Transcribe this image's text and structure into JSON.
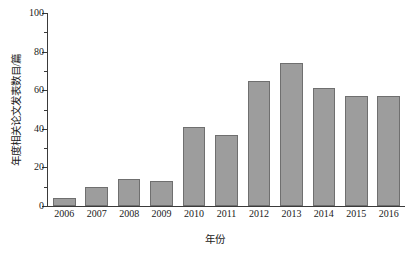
{
  "chart_data": {
    "type": "bar",
    "title": "",
    "xlabel": "年份",
    "ylabel": "年度相关论文发表数目/篇",
    "categories": [
      "2006",
      "2007",
      "2008",
      "2009",
      "2010",
      "2011",
      "2012",
      "2013",
      "2014",
      "2015",
      "2016"
    ],
    "values": [
      4,
      10,
      14,
      13,
      41,
      37,
      65,
      74,
      61,
      57,
      57
    ],
    "series": [
      {
        "name": "年度相关论文发表数目",
        "values": [
          4,
          10,
          14,
          13,
          41,
          37,
          65,
          74,
          61,
          57,
          57
        ]
      }
    ],
    "ylim": [
      0,
      100
    ],
    "y_ticks": [
      0,
      20,
      40,
      60,
      80,
      100
    ],
    "y_tick_labels": [
      "0",
      "20",
      "40",
      "60",
      "80",
      "100"
    ],
    "y_minor_ticks": [
      10,
      30,
      50,
      70,
      90
    ],
    "grid": false,
    "legend": false,
    "legend_position": "none",
    "bar_color": "#9d9d9d",
    "bar_edge_color": "#6f6f6f",
    "axis_color": "#3a3a3a",
    "background_color": "#ffffff"
  }
}
